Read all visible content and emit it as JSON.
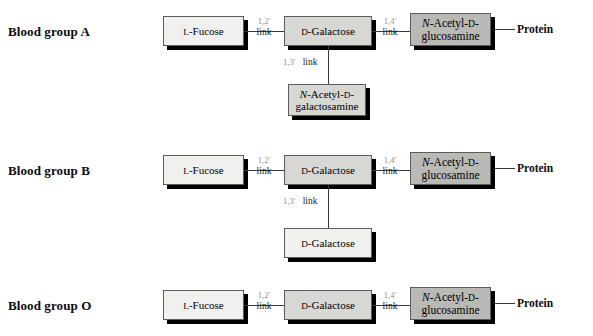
{
  "figure": {
    "title_remnant": "",
    "protein_label": "Protein"
  },
  "labels": {
    "group_a": "Blood group A",
    "group_b": "Blood group B",
    "group_o": "Blood group O"
  },
  "molecules": {
    "fucose": {
      "prefix": "L",
      "name": "-Fucose",
      "full": "L-Fucose"
    },
    "galactose": {
      "prefix": "D",
      "name": "-Galactose",
      "full": "D-Galactose"
    },
    "glcnac_line1_italic": "N",
    "glcnac_line1_rest": "-Acetyl-",
    "glcnac_line1_d": "D",
    "glcnac_line1_dash": "-",
    "glcnac_line2": "glucosamine",
    "glcnac_full": "N-Acetyl-D-glucosamine",
    "galnac_line1_italic": "N",
    "galnac_line1_rest": "-Acetyl-",
    "galnac_line1_d": "D",
    "galnac_line1_dash": "-",
    "galnac_line2": "galactosamine",
    "galnac_full": "N-Acetyl-D-galactosamine"
  },
  "links": {
    "one_two_num": "1,2′",
    "one_four_num": "1,4′",
    "one_three_num": "1,3′",
    "word": "link"
  },
  "colors": {
    "box_light": "#f0f0ee",
    "box_mid": "#d7d7d4",
    "box_dark": "#b9b9b6",
    "border": "#5c5c5c",
    "shadow": "#000000",
    "line": "#3a3a3a",
    "text": "#000000",
    "link_num": "#8e8e8e",
    "page_bg": "#ffffff"
  },
  "rows": [
    {
      "id": "blood-group-a",
      "label": "Blood group A",
      "chain": [
        "L-Fucose",
        "D-Galactose",
        "N-Acetyl-D-glucosamine"
      ],
      "branch": "N-Acetyl-D-galactosamine",
      "links": [
        "1,2′ link",
        "1,4′ link"
      ],
      "branch_link": "1,3′ link",
      "terminus": "Protein"
    },
    {
      "id": "blood-group-b",
      "label": "Blood group B",
      "chain": [
        "L-Fucose",
        "D-Galactose",
        "N-Acetyl-D-glucosamine"
      ],
      "branch": "D-Galactose",
      "links": [
        "1,2′ link",
        "1,4′ link"
      ],
      "branch_link": "1,3′ link",
      "terminus": "Protein"
    },
    {
      "id": "blood-group-o",
      "label": "Blood group O",
      "chain": [
        "L-Fucose",
        "D-Galactose",
        "N-Acetyl-D-glucosamine"
      ],
      "branch": null,
      "links": [
        "1,2′ link",
        "1,4′ link"
      ],
      "branch_link": null,
      "terminus": "Protein"
    }
  ]
}
